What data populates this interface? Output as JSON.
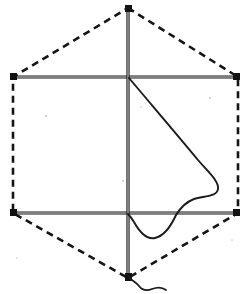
{
  "figure": {
    "title": "Kite frame and sail diagram",
    "caption": "",
    "width": 249,
    "height": 294,
    "background_color": "#ffffff",
    "ink_color": "#1a1a1a",
    "paper_tint": "#fbfbf9"
  },
  "style": {
    "spar_color": "#141414",
    "spar_width": 3.2,
    "spar_inner_color": "#ffffff",
    "spar_inner_width": 0.9,
    "dash_color": "#151515",
    "dash_width": 2.6,
    "dash_pattern": "7,5",
    "curve_color": "#1b1b1b",
    "curve_width": 1.9,
    "tail_color": "#1b1b1b",
    "tail_width": 1.8,
    "fitting_color": "#121212"
  },
  "geometry": {
    "apex": {
      "label": "top apex",
      "x": 128,
      "y": 8
    },
    "foot": {
      "label": "bottom tip",
      "x": 128,
      "y": 278
    },
    "mast_top": {
      "x": 128,
      "y": 8
    },
    "mast_bottom": {
      "x": 128,
      "y": 278
    },
    "upper_spar": {
      "label": "upper cross spar",
      "x1": 13,
      "y1": 77,
      "x2": 238,
      "y2": 77
    },
    "lower_spar": {
      "label": "lower cross spar",
      "x1": 13,
      "y1": 213,
      "x2": 238,
      "y2": 213
    },
    "upper_cross": {
      "x": 128,
      "y": 77
    },
    "lower_cross": {
      "x": 128,
      "y": 213
    },
    "hex_vertices": [
      {
        "name": "apex",
        "x": 128,
        "y": 8
      },
      {
        "name": "upper-right",
        "x": 238,
        "y": 77
      },
      {
        "name": "lower-right",
        "x": 238,
        "y": 213
      },
      {
        "name": "foot",
        "x": 128,
        "y": 278
      },
      {
        "name": "lower-left",
        "x": 13,
        "y": 213
      },
      {
        "name": "upper-left",
        "x": 13,
        "y": 77
      }
    ]
  },
  "elements": {
    "mast": {
      "name": "vertical-mast-spar",
      "path": "M 128 8 L 128 278"
    },
    "upper_spar": {
      "name": "upper-horizontal-spar",
      "path": "M 13 77 L 238 77"
    },
    "lower_spar": {
      "name": "lower-horizontal-spar",
      "path": "M 13 213 L 238 213"
    },
    "dashed_outline": {
      "name": "dashed-hexagon-outline",
      "path": "M 128 8 L 238 77 L 238 213 L 128 278 L 13 213 L 13 77 Z"
    },
    "sail_curve": {
      "name": "sail-leech-curve",
      "path": "M 129 78 C 150 103, 180 138, 198 160 C 209 173, 219 181, 218 189 C 217 197, 203 196, 194 199 C 186 202, 181 207, 176 215 C 171 226, 164 236, 155 238 C 146 240, 139 231, 134 222 C 131 217, 129 215, 128 214"
    },
    "tail_curve": {
      "name": "kite-tail-wavy-line",
      "path": "M 129 277 C 132 281, 136 282, 139 286 C 142 290, 147 291, 152 289 C 157 287, 162 287, 166 290"
    },
    "fittings": [
      {
        "name": "apex-fitting",
        "x": 125,
        "y": 5,
        "w": 7,
        "h": 7
      },
      {
        "name": "upper-left-fitting",
        "x": 10,
        "y": 73,
        "w": 7,
        "h": 7
      },
      {
        "name": "upper-right-fitting",
        "x": 233,
        "y": 73,
        "w": 7,
        "h": 7
      },
      {
        "name": "lower-left-fitting",
        "x": 10,
        "y": 209,
        "w": 7,
        "h": 7
      },
      {
        "name": "lower-right-fitting",
        "x": 233,
        "y": 209,
        "w": 7,
        "h": 7
      },
      {
        "name": "foot-fitting",
        "x": 125,
        "y": 273,
        "w": 7,
        "h": 8
      }
    ],
    "specks": [
      {
        "name": "paper-speck",
        "x": 46,
        "y": 116,
        "r": 0.8
      },
      {
        "name": "paper-speck",
        "x": 123,
        "y": 181,
        "r": 0.7
      },
      {
        "name": "paper-speck",
        "x": 210,
        "y": 98,
        "r": 0.7
      },
      {
        "name": "paper-speck",
        "x": 141,
        "y": 107,
        "r": 0.6
      },
      {
        "name": "paper-speck",
        "x": 17,
        "y": 258,
        "r": 0.6
      },
      {
        "name": "paper-speck",
        "x": 232,
        "y": 240,
        "r": 0.6
      }
    ]
  },
  "chart_data": {
    "type": "diagram",
    "title": "Kite frame and sail diagram",
    "parts": [
      {
        "name": "vertical mast",
        "kind": "solid spar",
        "from": "apex (128,8)",
        "to": "foot (128,278)"
      },
      {
        "name": "upper cross spar",
        "kind": "solid spar",
        "from": "(13,77)",
        "to": "(238,77)"
      },
      {
        "name": "lower cross spar",
        "kind": "solid spar",
        "from": "(13,213)",
        "to": "(238,213)"
      },
      {
        "name": "outline",
        "kind": "dashed hexagon",
        "vertices": 6
      },
      {
        "name": "sail leech",
        "kind": "freehand curve",
        "from": "upper cross (128,77)",
        "to": "lower cross (128,213)"
      },
      {
        "name": "tail",
        "kind": "wavy line",
        "from": "foot (128,278)",
        "to": "(166,290)"
      }
    ]
  }
}
